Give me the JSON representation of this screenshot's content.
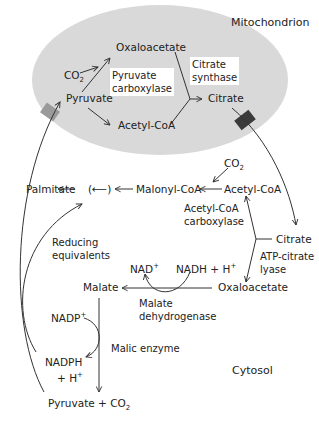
{
  "regions": {
    "mitochondrion": "Mitochondrion",
    "cytosol": "Cytosol"
  },
  "mito": {
    "oxaloacetate": "Oxaloacetate",
    "co2": "CO",
    "co2_sub": "2",
    "pyruvate": "Pyruvate",
    "acetyl_coa": "Acetyl-CoA",
    "citrate": "Citrate",
    "pyruvate_carboxylase_1": "Pyruvate",
    "pyruvate_carboxylase_2": "carboxylase",
    "citrate_synthase_1": "Citrate",
    "citrate_synthase_2": "synthase"
  },
  "cyto": {
    "palmitate": "Palmitate",
    "repeat": "(⟵)",
    "malonyl_coa": "Malonyl-CoA",
    "acetyl_coa": "Acetyl-CoA",
    "co2": "CO",
    "co2_sub": "2",
    "acc_1": "Acetyl-CoA",
    "acc_2": "carboxylase",
    "citrate": "Citrate",
    "acl_1": "ATP-citrate",
    "acl_2": "lyase",
    "reducing_1": "Reducing",
    "reducing_2": "equivalents",
    "nad": "NAD",
    "nad_sup": "+",
    "nadh": "NADH + H",
    "nadh_sup": "+",
    "malate": "Malate",
    "oxaloacetate": "Oxaloacetate",
    "mdh_1": "Malate",
    "mdh_2": "dehydrogenase",
    "nadp": "NADP",
    "nadp_sup": "+",
    "malic_enzyme": "Malic enzyme",
    "nadph_1": "NADPH",
    "nadph_2": "+ H",
    "nadph_sup": "+",
    "pyruvate_co2": "Pyruvate + CO",
    "pyruvate_co2_sub": "2"
  },
  "colors": {
    "mitochondrion_fill": "#d9d9d9",
    "pyruvate_transporter": "#9a9a9a",
    "citrate_transporter": "#3a3a3a",
    "arrow": "#333333"
  }
}
